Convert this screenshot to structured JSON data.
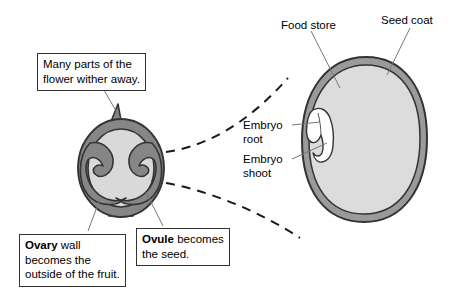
{
  "diagram": {
    "width": 461,
    "height": 296,
    "background_color": "#ffffff"
  },
  "callouts": {
    "wither": {
      "line1": "Many parts of the",
      "line2": "flower wither away."
    },
    "ovary": {
      "lead": "Ovary",
      "rest1": " wall",
      "line2": "becomes the",
      "line3": "outside of the fruit."
    },
    "ovule": {
      "lead": "Ovule",
      "rest1": " becomes",
      "line2": "the seed."
    }
  },
  "labels": {
    "food_store": "Food store",
    "seed_coat": "Seed coat",
    "embryo_root_line1": "Embryo",
    "embryo_root_line2": "root",
    "embryo_shoot_line1": "Embryo",
    "embryo_shoot_line2": "shoot"
  },
  "colors": {
    "outline": "#333333",
    "ovary_wall_fill": "#868686",
    "ovary_cavity_fill": "#d9d9d9",
    "ovule_fill": "#868686",
    "seed_coat_fill": "#9a9a9a",
    "food_store_fill": "#dcdcdc",
    "embryo_fill": "#ffffff",
    "leader_line": "#777777",
    "dashed_line": "#1a1a1a",
    "text": "#000000",
    "box_border": "#333333",
    "page_background": "#ffffff"
  }
}
